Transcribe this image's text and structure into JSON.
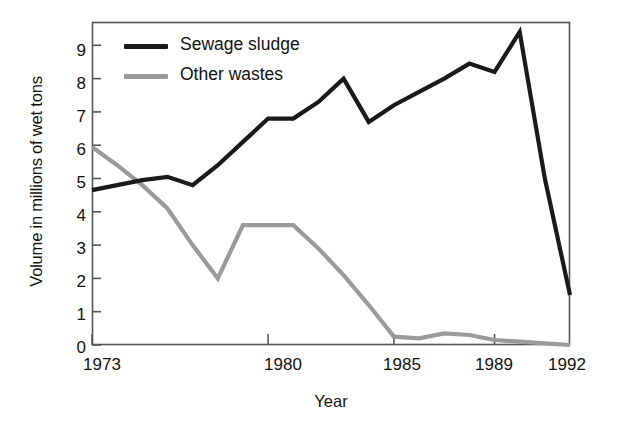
{
  "chart_data": {
    "type": "line",
    "title": "",
    "xlabel": "Year",
    "ylabel": "Volume in millions of wet tons",
    "xlim": [
      1973,
      1992
    ],
    "ylim": [
      0,
      9.7
    ],
    "grid": false,
    "legend_position": "top-left inside",
    "x_ticks": [
      1973,
      1980,
      1985,
      1989,
      1992
    ],
    "x_tick_labels": [
      "1973",
      "1980",
      "1985",
      "1989",
      "1992"
    ],
    "y_ticks": [
      0,
      1,
      2,
      3,
      4,
      5,
      6,
      7,
      8,
      9
    ],
    "y_tick_labels": [
      "0",
      "1",
      "2",
      "3",
      "4",
      "5",
      "6",
      "7",
      "8",
      "9"
    ],
    "x": [
      1973,
      1974,
      1975,
      1976,
      1977,
      1978,
      1979,
      1980,
      1981,
      1982,
      1983,
      1984,
      1985,
      1986,
      1987,
      1988,
      1989,
      1990,
      1991,
      1992
    ],
    "series": [
      {
        "name": "Sewage sludge",
        "color": "#1a1a1a",
        "width": 4.2,
        "values": [
          4.65,
          4.8,
          4.95,
          5.05,
          4.8,
          5.4,
          6.1,
          6.8,
          6.8,
          7.3,
          8.0,
          6.7,
          7.2,
          7.6,
          8.0,
          8.45,
          8.2,
          9.4,
          5.0,
          1.5
        ]
      },
      {
        "name": "Other wastes",
        "color": "#9a9a9a",
        "width": 4.2,
        "values": [
          5.95,
          5.4,
          4.8,
          4.1,
          3.0,
          2.0,
          3.6,
          3.6,
          3.6,
          2.9,
          2.1,
          1.2,
          0.25,
          0.2,
          0.35,
          0.3,
          0.15,
          0.1,
          0.05,
          0.0
        ]
      }
    ],
    "legend": [
      {
        "label": "Sewage sludge",
        "color": "#1a1a1a"
      },
      {
        "label": "Other wastes",
        "color": "#9a9a9a"
      }
    ]
  },
  "axes": {
    "frame_color": "#555555"
  }
}
